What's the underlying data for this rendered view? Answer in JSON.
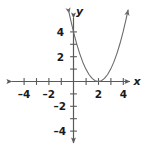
{
  "figure": {
    "background_color": "#ffffff",
    "width": 146,
    "height": 147
  },
  "axes": {
    "x_axis_label": "x",
    "y_axis_label": "y",
    "axis_color": "#595959",
    "origin_px": {
      "x": 73.5,
      "y": 81.5
    },
    "unit_px": 12.4
  },
  "x_ticks": [
    {
      "value": -4,
      "label": "–4"
    },
    {
      "value": -3,
      "label": ""
    },
    {
      "value": -2,
      "label": "–2"
    },
    {
      "value": -1,
      "label": ""
    },
    {
      "value": 1,
      "label": ""
    },
    {
      "value": 2,
      "label": "2"
    },
    {
      "value": 3,
      "label": ""
    },
    {
      "value": 4,
      "label": "4"
    }
  ],
  "y_ticks": [
    {
      "value": 4,
      "label": "4"
    },
    {
      "value": 3,
      "label": ""
    },
    {
      "value": 2,
      "label": "2"
    },
    {
      "value": 1,
      "label": ""
    },
    {
      "value": -1,
      "label": ""
    },
    {
      "value": -2,
      "label": "–2"
    },
    {
      "value": -3,
      "label": ""
    },
    {
      "value": -4,
      "label": "–4"
    }
  ],
  "curve": {
    "color": "#6b6b6b",
    "stroke_width": 1.1,
    "has_arrow_start": true,
    "has_arrow_end": true
  },
  "chart_data": {
    "type": "line",
    "title": "",
    "subtitle": "",
    "xlabel": "x",
    "ylabel": "y",
    "xlim": [
      -5,
      5
    ],
    "ylim": [
      -5,
      5
    ],
    "grid": false,
    "legend": null,
    "annotations": [],
    "series": [
      {
        "name": "y = (x - 2)^2",
        "equation": "y = (x - 2)^2",
        "vertex": [
          2,
          0
        ],
        "x_intercepts": [
          2
        ],
        "y_intercept": 4,
        "x": [
          -0.35,
          -0.2,
          0.0,
          0.25,
          0.5,
          0.75,
          1.0,
          1.25,
          1.5,
          1.75,
          2.0,
          2.25,
          2.5,
          2.75,
          3.0,
          3.25,
          3.5,
          3.75,
          4.0,
          4.25,
          4.4
        ],
        "y": [
          5.52,
          4.84,
          4.0,
          3.06,
          2.25,
          1.56,
          1.0,
          0.5625,
          0.25,
          0.0625,
          0.0,
          0.0625,
          0.25,
          0.5625,
          1.0,
          1.5625,
          2.25,
          3.0625,
          4.0,
          5.0625,
          5.76
        ]
      }
    ]
  }
}
